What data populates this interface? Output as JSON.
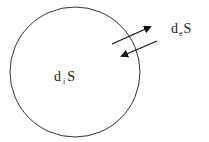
{
  "diagram": {
    "system": {
      "shape": "circle",
      "label_base": "d",
      "label_sub": "i",
      "label_tail": "S"
    },
    "exchange": {
      "label_base": "d",
      "label_sub": "e",
      "label_tail": "S",
      "arrows": [
        {
          "direction": "outward"
        },
        {
          "direction": "inward"
        }
      ]
    },
    "colors": {
      "stroke": "#333333",
      "arrow": "#111111",
      "text": "#222222"
    }
  }
}
